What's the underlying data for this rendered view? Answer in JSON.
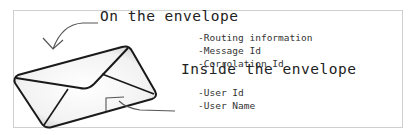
{
  "outside": {
    "heading": "On the envelope",
    "items": [
      "-Routing information",
      "-Message Id",
      "-Corrolation Id"
    ]
  },
  "inside": {
    "heading": "Inside the envelope",
    "items": [
      "-User Id",
      "-User Name"
    ]
  },
  "icons": {
    "envelope": "envelope-icon",
    "outer_arrow": "curved-arrow-icon",
    "inner_arrow": "curved-arrow-icon"
  }
}
